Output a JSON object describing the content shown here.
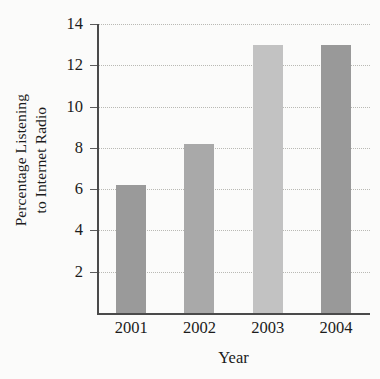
{
  "chart_data": {
    "type": "bar",
    "title": "",
    "subtitle": "",
    "xlabel": "Year",
    "ylabel": "Percentage Listening to Internet Radio",
    "ylabel_line1": "Percentage Listening",
    "ylabel_line2": "to Internet Radio",
    "categories": [
      "2001",
      "2002",
      "2003",
      "2004"
    ],
    "values": [
      6.2,
      8.2,
      13.0,
      13.0
    ],
    "bar_colors": [
      "#9a9a9a",
      "#a9a9a9",
      "#c2c2c2",
      "#999999"
    ],
    "ylim": [
      0,
      14
    ],
    "yticks": [
      2,
      4,
      6,
      8,
      10,
      12,
      14
    ],
    "ytick_labels": [
      "2",
      "4",
      "6",
      "8",
      "10",
      "12",
      "14"
    ],
    "xlim": [
      0,
      4
    ],
    "grid": true,
    "grid_axis": "y",
    "grid_style": "dotted",
    "grid_color": "#b9b9b4",
    "legend": false,
    "legend_position": "none",
    "axis_color": "#4a4a4a",
    "text_color": "#1b1b1b",
    "background_color": "#fbfbfa"
  }
}
